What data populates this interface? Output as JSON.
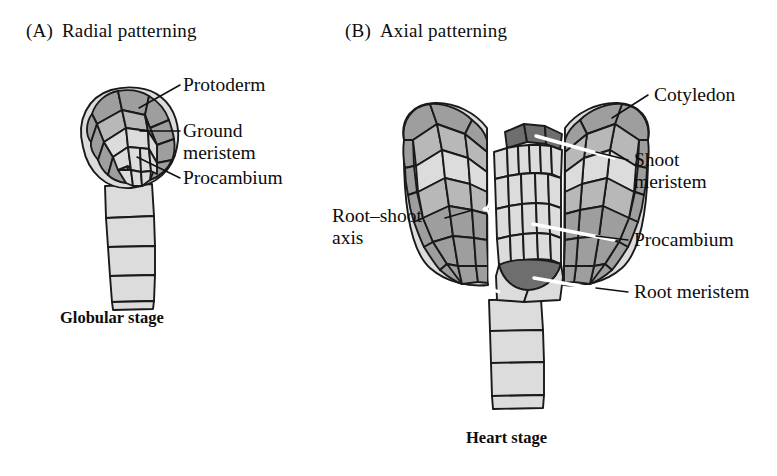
{
  "figure": {
    "kind": "plant-embryo-development-diagram",
    "panels": [
      {
        "tag": "(A)",
        "title": "Radial patterning",
        "caption": "Globular stage",
        "labels": [
          {
            "id": "protoderm",
            "text": "Protoderm"
          },
          {
            "id": "ground-meristem",
            "text": "Ground",
            "text2": "meristem"
          },
          {
            "id": "procambium",
            "text": "Procambium"
          }
        ]
      },
      {
        "tag": "(B)",
        "title": "Axial patterning",
        "caption": "Heart stage",
        "labels": [
          {
            "id": "cotyledon",
            "text": "Cotyledon"
          },
          {
            "id": "shoot-meristem",
            "text": "Shoot",
            "text2": "meristem"
          },
          {
            "id": "procambium",
            "text": "Procambium"
          },
          {
            "id": "root-meristem",
            "text": "Root meristem"
          },
          {
            "id": "root-shoot-axis",
            "text": "Root–shoot",
            "text2": "axis"
          }
        ]
      }
    ],
    "colors": {
      "background": "#ffffff",
      "ink": "#0d0d0d",
      "outline": "#1a1a1a",
      "cell_light": "#dcdcdc",
      "cell_medium": "#b8b8b8",
      "cell_dark": "#8a8a8a",
      "meristem_dark": "#6e6e6e",
      "leader_line": "#111111",
      "bracket": "#ffffff"
    }
  }
}
